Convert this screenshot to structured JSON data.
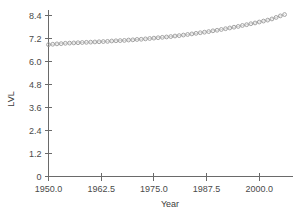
{
  "chart_data": {
    "type": "scatter",
    "title": "",
    "xlabel": "Year",
    "ylabel": "LVL",
    "grid": false,
    "legend": false,
    "xlim": [
      1950.0,
      2008.0
    ],
    "ylim": [
      0,
      9.0
    ],
    "xticks": [
      "1950.0",
      "1962.5",
      "1975.0",
      "1987.5",
      "2000.0"
    ],
    "xtick_values": [
      1950.0,
      1962.5,
      1975.0,
      1987.5,
      2000.0
    ],
    "yticks": [
      "0",
      "1.2",
      "2.4",
      "3.6",
      "4.8",
      "6.0",
      "7.2",
      "8.4"
    ],
    "ytick_values": [
      0,
      1.2,
      2.4,
      3.6,
      4.8,
      6.0,
      7.2,
      8.4
    ],
    "marker": "open-circle",
    "marker_color": "#9a9a9a",
    "line_color": "#bdbdbd",
    "axis_color": "#6a6a6a",
    "series": [
      {
        "name": "LVL",
        "x": [
          1950,
          1951,
          1952,
          1953,
          1954,
          1955,
          1956,
          1957,
          1958,
          1959,
          1960,
          1961,
          1962,
          1963,
          1964,
          1965,
          1966,
          1967,
          1968,
          1969,
          1970,
          1971,
          1972,
          1973,
          1974,
          1975,
          1976,
          1977,
          1978,
          1979,
          1980,
          1981,
          1982,
          1983,
          1984,
          1985,
          1986,
          1987,
          1988,
          1989,
          1990,
          1991,
          1992,
          1993,
          1994,
          1995,
          1996,
          1997,
          1998,
          1999,
          2000,
          2001,
          2002,
          2003,
          2004,
          2005,
          2006
        ],
        "y": [
          6.88,
          6.9,
          6.92,
          6.93,
          6.95,
          6.96,
          6.97,
          6.98,
          6.99,
          7.0,
          7.01,
          7.02,
          7.03,
          7.04,
          7.05,
          7.07,
          7.08,
          7.09,
          7.1,
          7.12,
          7.13,
          7.15,
          7.16,
          7.18,
          7.2,
          7.22,
          7.24,
          7.26,
          7.28,
          7.3,
          7.33,
          7.35,
          7.38,
          7.41,
          7.44,
          7.47,
          7.5,
          7.53,
          7.56,
          7.6,
          7.63,
          7.67,
          7.71,
          7.75,
          7.79,
          7.83,
          7.88,
          7.92,
          7.97,
          8.01,
          8.06,
          8.11,
          8.16,
          8.22,
          8.3,
          8.38,
          8.45
        ]
      }
    ]
  }
}
